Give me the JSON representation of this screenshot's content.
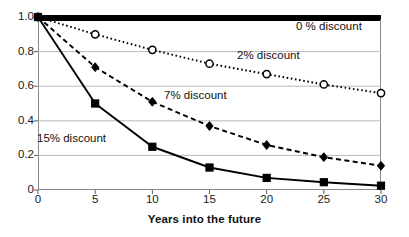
{
  "chart_data": {
    "type": "line",
    "title": "",
    "subtitle": "",
    "xlabel": "Years into the future",
    "ylabel": "",
    "x": [
      0,
      5,
      10,
      15,
      20,
      25,
      30
    ],
    "xlim": [
      0,
      30
    ],
    "ylim": [
      0,
      1.0
    ],
    "xticks": [
      "0",
      "5",
      "10",
      "15",
      "20",
      "25",
      "30"
    ],
    "yticks": [
      "0",
      "0.2",
      "0.4",
      "0.6",
      "0.8",
      "1.0"
    ],
    "ytick_values": [
      0,
      0.2,
      0.4,
      0.6,
      0.8,
      1.0
    ],
    "grid": "horizontal",
    "gridlines_at": [
      0.2,
      0.4,
      0.6,
      0.8
    ],
    "legend_position": "inline-annotations",
    "series": [
      {
        "name": "0 % discount",
        "label": "0 % discount",
        "values": [
          1.0,
          1.0,
          1.0,
          1.0,
          1.0,
          1.0,
          1.0
        ],
        "line_style": "solid-thick",
        "marker": "none",
        "color": "#000000",
        "label_x": 30,
        "label_y": 4
      },
      {
        "name": "2% discount",
        "label": "2% discount",
        "values": [
          1.0,
          0.9,
          0.81,
          0.73,
          0.67,
          0.61,
          0.56
        ],
        "line_style": "dotted",
        "marker": "open-circle",
        "color": "#000000",
        "label_x": 237,
        "label_y": 50
      },
      {
        "name": "7% discount",
        "label": "7% discount",
        "values": [
          1.0,
          0.71,
          0.51,
          0.37,
          0.26,
          0.19,
          0.14
        ],
        "line_style": "dashed",
        "marker": "filled-diamond",
        "color": "#000000",
        "label_x": 164,
        "label_y": 90
      },
      {
        "name": "15% discount",
        "label": "15% discount",
        "values": [
          1.0,
          0.5,
          0.25,
          0.13,
          0.07,
          0.045,
          0.025
        ],
        "line_style": "solid",
        "marker": "filled-square",
        "color": "#000000",
        "label_x": 37,
        "label_y": 133
      }
    ]
  },
  "axes": {
    "plot_left": 38,
    "plot_top": 17,
    "plot_right": 381,
    "plot_bottom": 190,
    "frame_color": "#8a8a8a",
    "gridline_color": "#b8b8b8",
    "background": "#ffffff"
  }
}
